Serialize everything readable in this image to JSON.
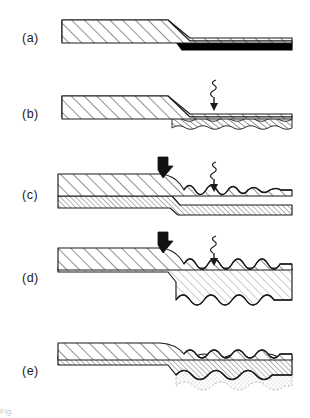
{
  "figure": {
    "width": 310,
    "height": 418,
    "background": "#ffffff",
    "ink": "#1a1a1a",
    "partial_caption": "Fig."
  },
  "panels": [
    {
      "id": "a",
      "label": "(a)",
      "label_x": 22,
      "label_y": 39,
      "description": "Hatched substrate wedge stepping down, with a solid black coating layer on the lower right section",
      "layers": [
        {
          "name": "substrate",
          "fill": "diagonal-hatch-wide"
        },
        {
          "name": "coating",
          "fill": "solid-black",
          "color": "#000000"
        }
      ],
      "symbols": []
    },
    {
      "id": "b",
      "label": "(b)",
      "label_x": 22,
      "label_y": 115,
      "description": "Coating layer has become roughened and textured after irradiation",
      "layers": [
        {
          "name": "substrate",
          "fill": "diagonal-hatch-wide"
        },
        {
          "name": "coating",
          "fill": "fine-rough-hatch"
        }
      ],
      "symbols": [
        {
          "name": "irradiation-symbol",
          "x": 213,
          "y": 86,
          "kind": "squiggle-arrow"
        }
      ]
    },
    {
      "id": "c",
      "label": "(c)",
      "label_x": 22,
      "label_y": 196,
      "description": "Two-layer stack; upper layer deforms and small ripples form in the exposed region",
      "layers": [
        {
          "name": "top-layer",
          "fill": "diagonal-hatch-wide"
        },
        {
          "name": "base-layer",
          "fill": "dense-hatch"
        }
      ],
      "symbols": [
        {
          "name": "pressure-arrow",
          "x": 162,
          "y": 163,
          "kind": "thick-black-arrow"
        },
        {
          "name": "irradiation-symbol",
          "x": 213,
          "y": 168,
          "kind": "squiggle-arrow"
        }
      ]
    },
    {
      "id": "d",
      "label": "(d)",
      "label_x": 22,
      "label_y": 279,
      "description": "Ripple amplitude grows; the swollen layer thickens markedly below the step",
      "layers": [
        {
          "name": "top-layer",
          "fill": "diagonal-hatch-wide"
        },
        {
          "name": "swollen-layer",
          "fill": "light-hatch"
        }
      ],
      "symbols": [
        {
          "name": "pressure-arrow",
          "x": 162,
          "y": 238,
          "kind": "thick-black-arrow"
        },
        {
          "name": "irradiation-symbol",
          "x": 213,
          "y": 243,
          "kind": "squiggle-arrow"
        }
      ]
    },
    {
      "id": "e",
      "label": "(e)",
      "label_x": 22,
      "label_y": 372,
      "description": "Final state: wavy layers with a stippled porous zone developing at the bottom",
      "layers": [
        {
          "name": "top-layer",
          "fill": "diagonal-hatch-wide"
        },
        {
          "name": "middle-layer",
          "fill": "dense-hatch"
        },
        {
          "name": "porous-zone",
          "fill": "stipple-dotted"
        }
      ],
      "symbols": []
    }
  ],
  "legend_keys": {
    "squiggle_arrow_meaning": "irradiation / energy input",
    "thick_arrow_meaning": "applied load / pressure"
  }
}
